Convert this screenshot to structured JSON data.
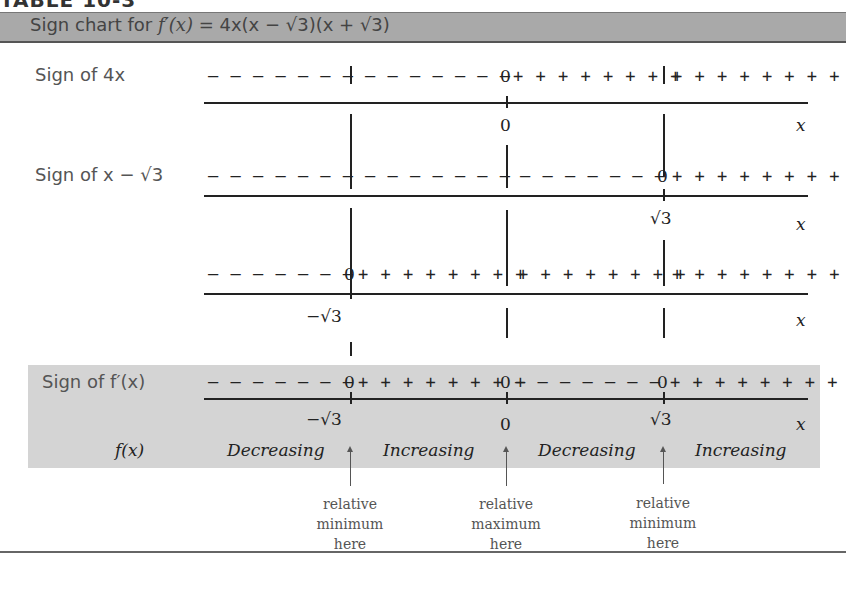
{
  "table": {
    "title": "TABLE 10-3",
    "header_prefix": "Sign chart for ",
    "header_func": "f′(x)",
    "header_eq": " = 4x(x − √3)(x + √3)"
  },
  "rows": [
    {
      "label": "Sign of 4x",
      "segments": [
        "– – – – – – –",
        "– – – – – – –",
        "+ + + + + + + +",
        "+ + + + + + + +"
      ],
      "zero_at": "0",
      "axis_labels": [
        "0"
      ]
    },
    {
      "label": "Sign of x − √3",
      "segments": [
        "– – – – – – –",
        "– – – – – – –",
        "– – – – – – –",
        "+ + + + + + + +"
      ],
      "zero_at": "√3",
      "axis_labels": [
        "√3"
      ]
    },
    {
      "label": "",
      "segments": [
        "– – – – – – –",
        "+ + + + + + + +",
        "+ + + + + + + +",
        "+ + + + + + + +"
      ],
      "zero_at": "−√3",
      "axis_labels": [
        "−√3"
      ]
    },
    {
      "label": "Sign of f′(x)",
      "segments": [
        "– – – – – – –",
        "+ + + + + + + +",
        "– – – – – – –",
        "+ + + + + + + +"
      ],
      "zero_at": [
        "−√3",
        "0",
        "√3"
      ],
      "axis_labels": [
        "−√3",
        "0",
        "√3"
      ]
    }
  ],
  "axis_var": "x",
  "zero_symbol": "0",
  "fx_label": "f(x)",
  "behavior": [
    "Decreasing",
    "Increasing",
    "Decreasing",
    "Increasing"
  ],
  "notes": [
    {
      "at": "−√3",
      "lines": [
        "relative",
        "minimum",
        "here"
      ]
    },
    {
      "at": "0",
      "lines": [
        "relative",
        "maximum",
        "here"
      ]
    },
    {
      "at": "√3",
      "lines": [
        "relative",
        "minimum",
        "here"
      ]
    }
  ],
  "colors": {
    "header_band": "#a9a9a9",
    "result_band": "#d4d4d4",
    "ink": "#222222"
  }
}
